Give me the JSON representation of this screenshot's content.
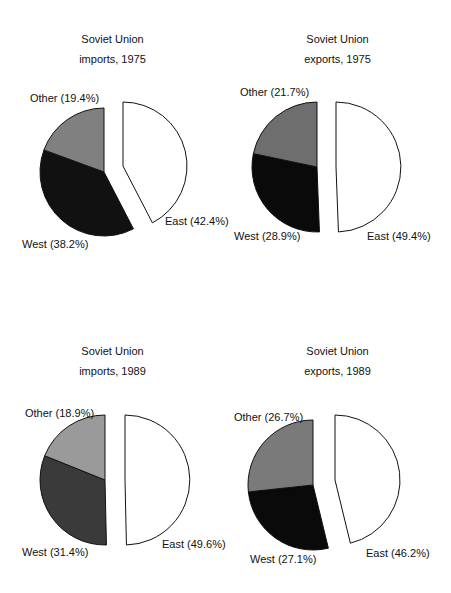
{
  "chart_data": [
    {
      "type": "pie",
      "title": "Soviet Union imports, 1975",
      "title_lines": [
        "Soviet Union",
        "imports, 1975"
      ],
      "slices": [
        {
          "name": "East",
          "value": 42.4,
          "label": "East (42.4%)",
          "exploded": true,
          "color": "#ffffff"
        },
        {
          "name": "West",
          "value": 38.2,
          "label": "West (38.2%)",
          "color": "#111111"
        },
        {
          "name": "Other",
          "value": 19.4,
          "label": "Other (19.4%)",
          "color": "#808080"
        }
      ]
    },
    {
      "type": "pie",
      "title": "Soviet Union exports, 1975",
      "title_lines": [
        "Soviet Union",
        "exports, 1975"
      ],
      "slices": [
        {
          "name": "East",
          "value": 49.4,
          "label": "East (49.4%)",
          "exploded": true,
          "color": "#ffffff"
        },
        {
          "name": "West",
          "value": 28.9,
          "label": "West (28.9%)",
          "color": "#0a0a0a"
        },
        {
          "name": "Other",
          "value": 21.7,
          "label": "Other (21.7%)",
          "color": "#6e6e6e"
        }
      ]
    },
    {
      "type": "pie",
      "title": "Soviet Union imports, 1989",
      "title_lines": [
        "Soviet Union",
        "imports, 1989"
      ],
      "slices": [
        {
          "name": "East",
          "value": 49.6,
          "label": "East (49.6%)",
          "exploded": true,
          "color": "#ffffff"
        },
        {
          "name": "West",
          "value": 31.4,
          "label": "West (31.4%)",
          "color": "#3a3a3a"
        },
        {
          "name": "Other",
          "value": 18.9,
          "label": "Other (18.9%)",
          "color": "#9a9a9a"
        }
      ]
    },
    {
      "type": "pie",
      "title": "Soviet Union exports, 1989",
      "title_lines": [
        "Soviet Union",
        "exports, 1989"
      ],
      "slices": [
        {
          "name": "East",
          "value": 46.2,
          "label": "East (46.2%)",
          "exploded": true,
          "color": "#ffffff"
        },
        {
          "name": "West",
          "value": 27.1,
          "label": "West (27.1%)",
          "color": "#0a0a0a"
        },
        {
          "name": "Other",
          "value": 26.7,
          "label": "Other (26.7%)",
          "color": "#7a7a7a"
        }
      ]
    }
  ]
}
